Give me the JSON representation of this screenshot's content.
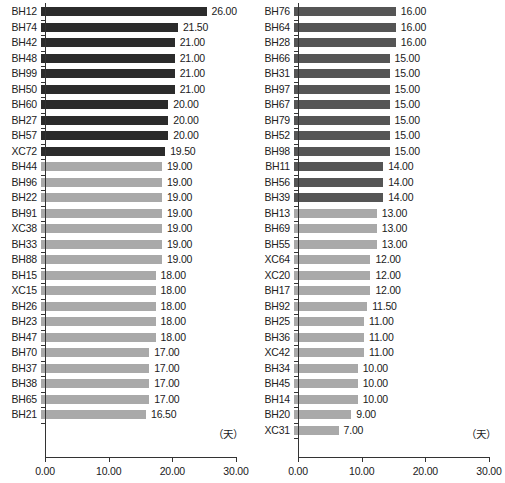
{
  "chart_data": [
    {
      "type": "bar",
      "panel": "left",
      "orientation": "horizontal",
      "title": "",
      "xlabel": "（天）",
      "ylabel": "",
      "xlim": [
        0,
        30
      ],
      "xticks": [
        "0.00",
        "10.00",
        "20.00",
        "30.00"
      ],
      "xtick_values": [
        0,
        10,
        20,
        30
      ],
      "grid": false,
      "legend": "none",
      "unit_label": "（天）",
      "categories": [
        "BH12",
        "BH74",
        "BH42",
        "BH48",
        "BH99",
        "BH50",
        "BH60",
        "BH27",
        "BH57",
        "XC72",
        "BH44",
        "BH96",
        "BH22",
        "BH91",
        "XC38",
        "BH33",
        "BH88",
        "BH15",
        "XC15",
        "BH26",
        "BH23",
        "BH47",
        "BH70",
        "BH37",
        "BH38",
        "BH65",
        "BH21"
      ],
      "values": [
        26.0,
        21.5,
        21.0,
        21.0,
        21.0,
        21.0,
        20.0,
        20.0,
        20.0,
        19.5,
        19.0,
        19.0,
        19.0,
        19.0,
        19.0,
        19.0,
        19.0,
        18.0,
        18.0,
        18.0,
        18.0,
        18.0,
        17.0,
        17.0,
        17.0,
        17.0,
        16.5
      ],
      "labels": [
        "26.00",
        "21.50",
        "21.00",
        "21.00",
        "21.00",
        "21.00",
        "20.00",
        "20.00",
        "20.00",
        "19.50",
        "19.00",
        "19.00",
        "19.00",
        "19.00",
        "19.00",
        "19.00",
        "19.00",
        "18.00",
        "18.00",
        "18.00",
        "18.00",
        "18.00",
        "17.00",
        "17.00",
        "17.00",
        "17.00",
        "16.50"
      ],
      "bar_colors": [
        "#2b2b2b",
        "#2b2b2b",
        "#2b2b2b",
        "#2b2b2b",
        "#2b2b2b",
        "#2b2b2b",
        "#2b2b2b",
        "#2b2b2b",
        "#2b2b2b",
        "#2b2b2b",
        "#a9a9a9",
        "#a9a9a9",
        "#a9a9a9",
        "#a9a9a9",
        "#a9a9a9",
        "#a9a9a9",
        "#a9a9a9",
        "#a9a9a9",
        "#a9a9a9",
        "#a9a9a9",
        "#a9a9a9",
        "#a9a9a9",
        "#a9a9a9",
        "#a9a9a9",
        "#a9a9a9",
        "#a9a9a9",
        "#a9a9a9"
      ]
    },
    {
      "type": "bar",
      "panel": "right",
      "orientation": "horizontal",
      "title": "",
      "xlabel": "（天）",
      "ylabel": "",
      "xlim": [
        0,
        30
      ],
      "xticks": [
        "0.00",
        "10.00",
        "20.00",
        "30.00"
      ],
      "xtick_values": [
        0,
        10,
        20,
        30
      ],
      "grid": false,
      "legend": "none",
      "unit_label": "（天）",
      "categories": [
        "BH76",
        "BH64",
        "BH28",
        "BH66",
        "BH31",
        "BH97",
        "BH67",
        "BH79",
        "BH52",
        "BH98",
        "BH11",
        "BH56",
        "BH39",
        "BH13",
        "BH69",
        "BH55",
        "XC64",
        "XC20",
        "BH17",
        "BH92",
        "BH25",
        "BH36",
        "XC42",
        "BH34",
        "BH45",
        "BH14",
        "BH20",
        "XC31"
      ],
      "values": [
        16.0,
        16.0,
        16.0,
        15.0,
        15.0,
        15.0,
        15.0,
        15.0,
        15.0,
        15.0,
        14.0,
        14.0,
        14.0,
        13.0,
        13.0,
        13.0,
        12.0,
        12.0,
        12.0,
        11.5,
        11.0,
        11.0,
        11.0,
        10.0,
        10.0,
        10.0,
        9.0,
        7.0
      ],
      "labels": [
        "16.00",
        "16.00",
        "16.00",
        "15.00",
        "15.00",
        "15.00",
        "15.00",
        "15.00",
        "15.00",
        "15.00",
        "14.00",
        "14.00",
        "14.00",
        "13.00",
        "13.00",
        "13.00",
        "12.00",
        "12.00",
        "12.00",
        "11.50",
        "11.00",
        "11.00",
        "11.00",
        "10.00",
        "10.00",
        "10.00",
        "9.00",
        "7.00"
      ],
      "bar_colors": [
        "#555555",
        "#555555",
        "#555555",
        "#555555",
        "#555555",
        "#555555",
        "#555555",
        "#555555",
        "#555555",
        "#555555",
        "#555555",
        "#555555",
        "#555555",
        "#a9a9a9",
        "#a9a9a9",
        "#a9a9a9",
        "#a9a9a9",
        "#a9a9a9",
        "#a9a9a9",
        "#a9a9a9",
        "#a9a9a9",
        "#a9a9a9",
        "#a9a9a9",
        "#a9a9a9",
        "#a9a9a9",
        "#a9a9a9",
        "#a9a9a9",
        "#a9a9a9"
      ]
    }
  ],
  "axis": {
    "origin_px": 45,
    "end_px": 236,
    "colors": {
      "axis": "#333333",
      "text": "#1a1a1a",
      "bar_dark": "#2b2b2b",
      "bar_mid": "#555555",
      "bar_light": "#a9a9a9",
      "background": "#ffffff"
    }
  }
}
